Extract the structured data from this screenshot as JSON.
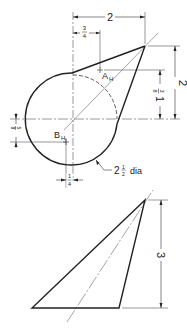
{
  "drawing": {
    "top_view": {
      "dim_width_total": "2",
      "dim_offset_A_num": "3",
      "dim_offset_A_den": "4",
      "dim_height_total": "2",
      "dim_A_height_whole": "1",
      "dim_A_height_num": "3",
      "dim_A_height_den": "8",
      "dim_B_vertical_num": "5",
      "dim_B_vertical_den": "8",
      "dim_B_horizontal_num": "1",
      "dim_B_horizontal_den": "4",
      "circle_dia_whole": "2",
      "circle_dia_num": "1",
      "circle_dia_den": "2",
      "circle_dia_suffix": "dia",
      "point_A_label": "A",
      "point_A_subscript": "H",
      "point_B_label": "B",
      "point_B_subscript": "H"
    },
    "front_view": {
      "dim_height": "3"
    }
  }
}
